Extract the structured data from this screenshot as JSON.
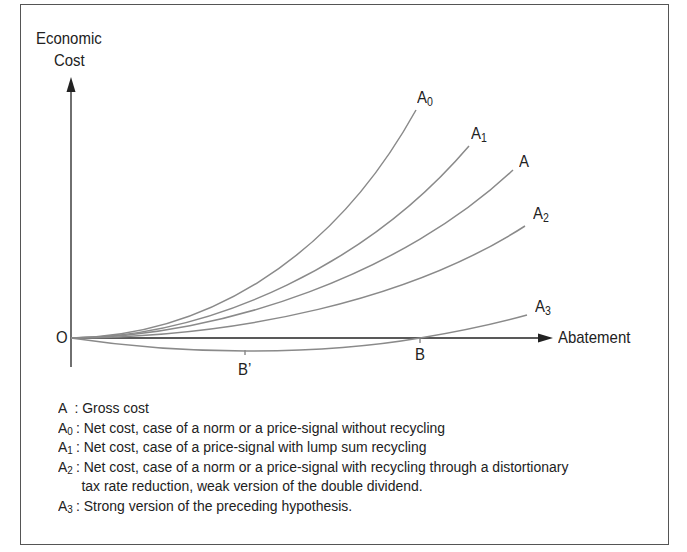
{
  "diagram": {
    "y_axis_label_line1": "Economic",
    "y_axis_label_line2": "Cost",
    "x_axis_label": "Abatement",
    "origin_label": "O",
    "points": {
      "B": "B",
      "B_prime": "B’"
    },
    "curves": [
      {
        "id": "A0",
        "base": "A",
        "sub": "0",
        "color": "#8a8a8a"
      },
      {
        "id": "A1",
        "base": "A",
        "sub": "1",
        "color": "#8a8a8a"
      },
      {
        "id": "A",
        "base": "A",
        "sub": "",
        "color": "#8a8a8a"
      },
      {
        "id": "A2",
        "base": "A",
        "sub": "2",
        "color": "#8a8a8a"
      },
      {
        "id": "A3",
        "base": "A",
        "sub": "3",
        "color": "#8a8a8a"
      }
    ],
    "colors": {
      "axis": "#222222",
      "curve": "#8a8a8a",
      "frame": "#555555"
    }
  },
  "legend": [
    {
      "key": "A",
      "sub": "",
      "sep": " : ",
      "text": "Gross cost"
    },
    {
      "key": "A",
      "sub": "0",
      "sep": ": ",
      "text": "Net cost, case of a norm or a price-signal without recycling"
    },
    {
      "key": "A",
      "sub": "1",
      "sep": ": ",
      "text": "Net cost, case of a price-signal with lump sum recycling"
    },
    {
      "key": "A",
      "sub": "2",
      "sep": ": ",
      "text": "Net cost, case of a norm or a price-signal with recycling through a distortionary",
      "continuation": "tax rate reduction, weak version of the double dividend."
    },
    {
      "key": "A",
      "sub": "3",
      "sep": ": ",
      "text": "Strong version of the preceding hypothesis."
    }
  ]
}
